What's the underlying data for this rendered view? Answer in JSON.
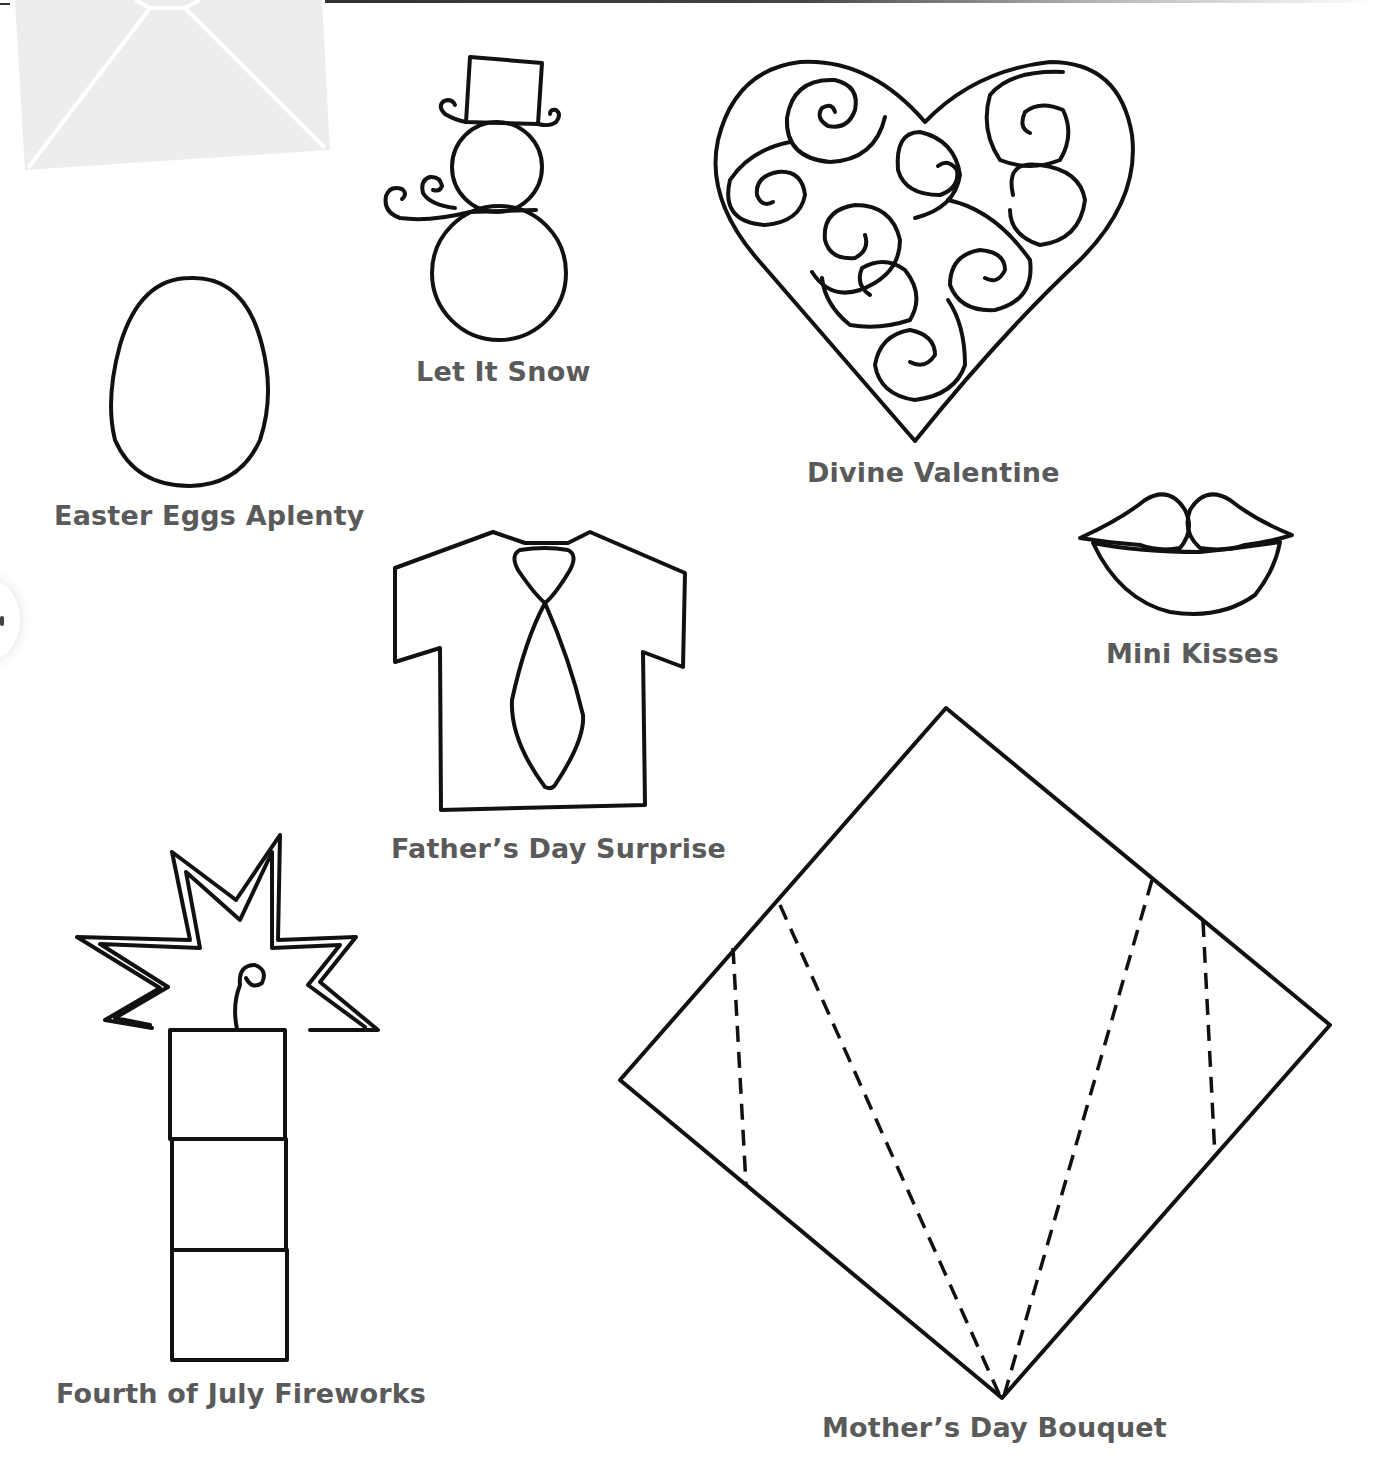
{
  "page": {
    "type": "craft template sheet",
    "colors": {
      "line": "#111111",
      "label": "#5a5a5a",
      "envelope_fill": "#ededed",
      "background": "#ffffff"
    }
  },
  "templates": [
    {
      "id": "snowman",
      "label": "Let It Snow",
      "icon": "snowman-icon"
    },
    {
      "id": "heart",
      "label": "Divine Valentine",
      "icon": "swirl-heart-icon"
    },
    {
      "id": "egg",
      "label": "Easter Eggs Aplenty",
      "icon": "egg-icon"
    },
    {
      "id": "lips",
      "label": "Mini Kisses",
      "icon": "lips-icon"
    },
    {
      "id": "shirt",
      "label": "Father’s Day Surprise",
      "icon": "shirt-tie-icon"
    },
    {
      "id": "fireworks",
      "label": "Fourth of July Fireworks",
      "icon": "firework-starburst-icon"
    },
    {
      "id": "bouquet",
      "label": "Mother’s Day Bouquet",
      "icon": "diamond-fold-icon"
    }
  ]
}
